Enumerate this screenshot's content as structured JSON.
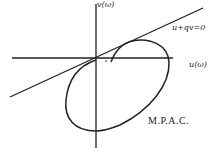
{
  "diagram": {
    "type": "popov-plot",
    "axes": {
      "vertical_label": "v(ω)",
      "horizontal_label": "u(ω)"
    },
    "line_label": "u+qv=0",
    "curve_label": "M.P.A.C.",
    "colors": {
      "ink": "#222222",
      "background": "#ffffff"
    }
  }
}
